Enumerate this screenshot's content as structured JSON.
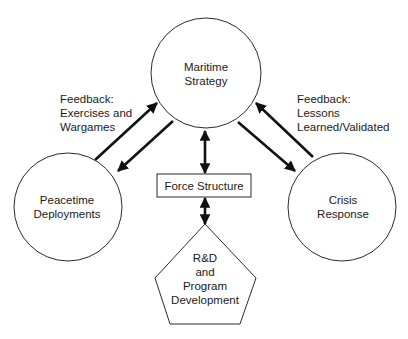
{
  "diagram": {
    "nodes": {
      "maritime_strategy": {
        "line1": "Maritime",
        "line2": "Strategy",
        "shape": "circle"
      },
      "peacetime_deployments": {
        "line1": "Peacetime",
        "line2": "Deployments",
        "shape": "circle"
      },
      "crisis_response": {
        "line1": "Crisis",
        "line2": "Response",
        "shape": "circle"
      },
      "force_structure": {
        "label": "Force Structure",
        "shape": "rectangle"
      },
      "rnd": {
        "line1": "R&D",
        "line2": "and",
        "line3": "Program",
        "line4": "Development",
        "shape": "pentagon"
      }
    },
    "labels": {
      "left_feedback": {
        "line1": "Feedback:",
        "line2": "Exercises and",
        "line3": "Wargames"
      },
      "right_feedback": {
        "line1": "Feedback:",
        "line2": "Lessons",
        "line3": "Learned/Validated"
      }
    },
    "edges": [
      {
        "from": "Peacetime Deployments",
        "to": "Maritime Strategy",
        "type": "arrow"
      },
      {
        "from": "Maritime Strategy",
        "to": "Peacetime Deployments",
        "type": "arrow"
      },
      {
        "from": "Crisis Response",
        "to": "Maritime Strategy",
        "type": "arrow"
      },
      {
        "from": "Maritime Strategy",
        "to": "Crisis Response",
        "type": "arrow"
      },
      {
        "from": "Maritime Strategy",
        "to": "Force Structure",
        "type": "bidirectional"
      },
      {
        "from": "Force Structure",
        "to": "R&D and Program Development",
        "type": "bidirectional"
      }
    ],
    "colors": {
      "line": "#111111",
      "background": "#ffffff",
      "text": "#1a1a1a"
    }
  }
}
